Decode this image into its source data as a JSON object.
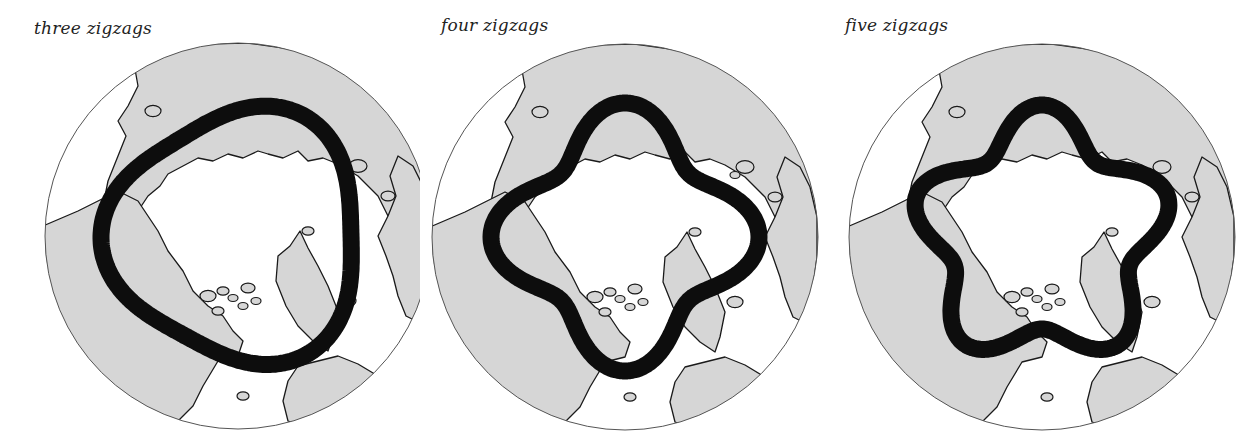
{
  "figure": {
    "panels": [
      {
        "label": "three zigzags",
        "lobes": 3
      },
      {
        "label": "four zigzags",
        "lobes": 4
      },
      {
        "label": "five zigzags",
        "lobes": 5
      }
    ]
  },
  "colors": {
    "land": "#d6d6d6",
    "ocean": "#ffffff",
    "coastline": "#1a1a1a",
    "band": "#0d0d0d",
    "globe_outline": "#555555"
  }
}
